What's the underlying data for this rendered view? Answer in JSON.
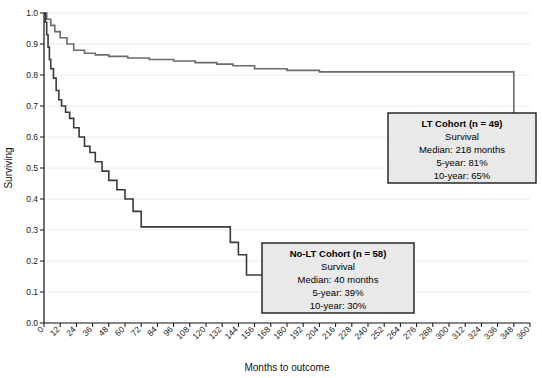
{
  "chart_data": {
    "type": "line",
    "title": "",
    "subtitle": "",
    "xlabel": "Months to outcome",
    "ylabel": "Surviving",
    "xlim": [
      0,
      360
    ],
    "ylim": [
      0.0,
      1.0
    ],
    "grid": true,
    "legend_position": "inside-annotation-boxes",
    "x_ticks": [
      0,
      12,
      24,
      36,
      48,
      60,
      72,
      84,
      96,
      108,
      120,
      132,
      144,
      156,
      168,
      180,
      192,
      204,
      216,
      228,
      240,
      252,
      264,
      276,
      288,
      300,
      312,
      324,
      336,
      348,
      360
    ],
    "y_ticks": [
      "0.0",
      "0.1",
      "0.2",
      "0.3",
      "0.4",
      "0.5",
      "0.6",
      "0.7",
      "0.8",
      "0.9",
      "1.0"
    ],
    "y_tick_values": [
      0.0,
      0.1,
      0.2,
      0.3,
      0.4,
      0.5,
      0.6,
      0.7,
      0.8,
      0.9,
      1.0
    ],
    "series": [
      {
        "name": "LT Cohort",
        "color": "#6b6b6b",
        "width": 1.6,
        "step": "post",
        "x": [
          0,
          2,
          5,
          8,
          12,
          17,
          22,
          30,
          38,
          48,
          62,
          78,
          96,
          112,
          128,
          140,
          156,
          180,
          204,
          228,
          252,
          276,
          300,
          336,
          348,
          360
        ],
        "y": [
          1.0,
          0.98,
          0.96,
          0.94,
          0.92,
          0.9,
          0.88,
          0.87,
          0.865,
          0.86,
          0.855,
          0.85,
          0.845,
          0.84,
          0.835,
          0.83,
          0.82,
          0.815,
          0.81,
          0.81,
          0.81,
          0.81,
          0.81,
          0.81,
          0.62,
          0.62
        ]
      },
      {
        "name": "No-LT Cohort",
        "color": "#3a3a3a",
        "width": 1.6,
        "step": "post",
        "x": [
          0,
          1,
          2,
          3,
          4,
          5,
          7,
          9,
          11,
          13,
          16,
          19,
          22,
          26,
          30,
          34,
          38,
          43,
          48,
          54,
          60,
          66,
          72,
          132,
          138,
          144,
          150,
          228
        ],
        "y": [
          1.0,
          0.97,
          0.93,
          0.89,
          0.85,
          0.82,
          0.79,
          0.75,
          0.72,
          0.7,
          0.68,
          0.66,
          0.63,
          0.6,
          0.57,
          0.55,
          0.52,
          0.49,
          0.46,
          0.43,
          0.4,
          0.36,
          0.31,
          0.31,
          0.26,
          0.22,
          0.155,
          0.07
        ]
      }
    ],
    "annotations": [
      {
        "id": "lt-cohort-box",
        "title": "LT Cohort (n = 49)",
        "lines": [
          "Survival",
          "Median: 218 months",
          "5-year: 81%",
          "10-year: 65%"
        ],
        "x": 388,
        "y": 113,
        "width": 148,
        "height": 70
      },
      {
        "id": "no-lt-cohort-box",
        "title": "No-LT Cohort (n = 58)",
        "lines": [
          "Survival",
          "Median: 40 months",
          "5-year: 39%",
          "10-year: 30%"
        ],
        "x": 262,
        "y": 243,
        "width": 152,
        "height": 70
      }
    ],
    "colors": {
      "lt_curve": "#6b6b6b",
      "nolt_curve": "#3a3a3a",
      "grid": "#ececec",
      "axis": "#111111",
      "annotation_fill": "#e9e9e9",
      "annotation_border": "#1a1a1a",
      "background": "#ffffff"
    }
  }
}
